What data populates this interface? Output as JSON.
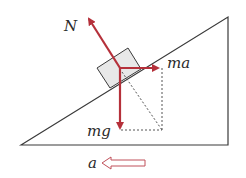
{
  "diagram": {
    "type": "free-body diagram on incline",
    "labels": {
      "normal_force": "N",
      "inertial_force": "ma",
      "gravity": "mg",
      "acceleration": "a"
    },
    "colors": {
      "force_arrow": "#b5303a",
      "outline": "#3a3a3a",
      "block_fill": "#e8e8e8",
      "accel_arrow": "#c0505a"
    }
  }
}
